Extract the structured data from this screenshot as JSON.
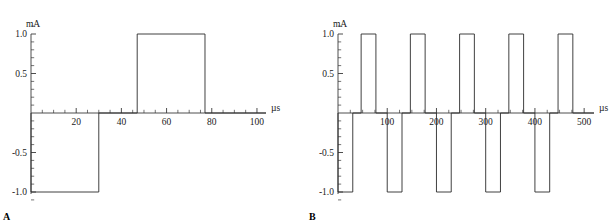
{
  "figure": {
    "panels": [
      {
        "id": "A",
        "label": "A",
        "ylabel": "mA",
        "xlabel": "µs",
        "y_ticks": [
          "1.0",
          "0.5",
          "-0.5",
          "-1.0"
        ],
        "x_ticks": [
          "20",
          "40",
          "60",
          "80",
          "100"
        ]
      },
      {
        "id": "B",
        "label": "B",
        "ylabel": "mA",
        "xlabel": "µs",
        "y_ticks": [
          "1.0",
          "0.5",
          "-0.5",
          "-1.0"
        ],
        "x_ticks": [
          "100",
          "200",
          "300",
          "400",
          "500"
        ]
      }
    ]
  },
  "chart_data": [
    {
      "type": "line",
      "panel": "A",
      "title": "",
      "xlabel": "µs",
      "ylabel": "mA",
      "xlim": [
        0,
        104
      ],
      "ylim": [
        -1.15,
        1.15
      ],
      "grid": false,
      "legend": "none",
      "x_major_ticks": [
        20,
        40,
        60,
        80,
        100
      ],
      "x_minor_step": 5,
      "y_major_ticks": [
        1.0,
        0.5,
        -0.5,
        -1.0
      ],
      "y_minor_step": 0.1,
      "x_tick_labels": [
        "20",
        "40",
        "60",
        "80",
        "100"
      ],
      "y_tick_labels": [
        "1.0",
        "0.5",
        "-0.5",
        "-1.0"
      ],
      "waveform_description": "Single biphasic current pulse: cathodic (negative) phase then interphase gap then anodic (positive) phase",
      "series": [
        {
          "name": "current",
          "x": [
            0,
            0,
            30,
            30,
            47,
            47,
            77,
            77,
            104
          ],
          "y": [
            0,
            -1.0,
            -1.0,
            0,
            0,
            1.0,
            1.0,
            0,
            0
          ]
        }
      ],
      "pulses": [
        {
          "phase": "negative",
          "start": 0,
          "end": 30,
          "amplitude": -1.0
        },
        {
          "phase": "gap",
          "start": 30,
          "end": 47,
          "amplitude": 0
        },
        {
          "phase": "positive",
          "start": 47,
          "end": 77,
          "amplitude": 1.0
        }
      ]
    },
    {
      "type": "line",
      "panel": "B",
      "title": "",
      "xlabel": "µs",
      "ylabel": "mA",
      "xlim": [
        0,
        520
      ],
      "ylim": [
        -1.15,
        1.15
      ],
      "grid": false,
      "legend": "none",
      "x_major_ticks": [
        100,
        200,
        300,
        400,
        500
      ],
      "x_minor_step": 25,
      "y_major_ticks": [
        1.0,
        0.5,
        -0.5,
        -1.0
      ],
      "y_minor_step": 0.1,
      "x_tick_labels": [
        "100",
        "200",
        "300",
        "400",
        "500"
      ],
      "y_tick_labels": [
        "1.0",
        "0.5",
        "-0.5",
        "-1.0"
      ],
      "waveform_description": "Pulse train of five biphasic current pulses repeating every 100 microseconds",
      "series": [
        {
          "name": "current",
          "x": [
            0,
            0,
            30,
            30,
            47,
            47,
            77,
            77,
            100,
            100,
            130,
            130,
            147,
            147,
            177,
            177,
            200,
            200,
            230,
            230,
            247,
            247,
            277,
            277,
            300,
            300,
            330,
            330,
            347,
            347,
            377,
            377,
            400,
            400,
            430,
            430,
            447,
            447,
            477,
            477,
            520
          ],
          "y": [
            0,
            -1.0,
            -1.0,
            0,
            0,
            1.0,
            1.0,
            0,
            0,
            -1.0,
            -1.0,
            0,
            0,
            1.0,
            1.0,
            0,
            0,
            -1.0,
            -1.0,
            0,
            0,
            1.0,
            1.0,
            0,
            0,
            -1.0,
            -1.0,
            0,
            0,
            1.0,
            1.0,
            0,
            0,
            -1.0,
            -1.0,
            0,
            0,
            1.0,
            1.0,
            0,
            0
          ]
        }
      ],
      "pulses": [
        {
          "phase": "negative",
          "start": 0,
          "end": 30,
          "amplitude": -1.0
        },
        {
          "phase": "positive",
          "start": 47,
          "end": 77,
          "amplitude": 1.0
        },
        {
          "phase": "negative",
          "start": 100,
          "end": 130,
          "amplitude": -1.0
        },
        {
          "phase": "positive",
          "start": 147,
          "end": 177,
          "amplitude": 1.0
        },
        {
          "phase": "negative",
          "start": 200,
          "end": 230,
          "amplitude": -1.0
        },
        {
          "phase": "positive",
          "start": 247,
          "end": 277,
          "amplitude": 1.0
        },
        {
          "phase": "negative",
          "start": 300,
          "end": 330,
          "amplitude": -1.0
        },
        {
          "phase": "positive",
          "start": 347,
          "end": 377,
          "amplitude": 1.0
        },
        {
          "phase": "negative",
          "start": 400,
          "end": 430,
          "amplitude": -1.0
        },
        {
          "phase": "positive",
          "start": 447,
          "end": 477,
          "amplitude": 1.0
        }
      ]
    }
  ]
}
